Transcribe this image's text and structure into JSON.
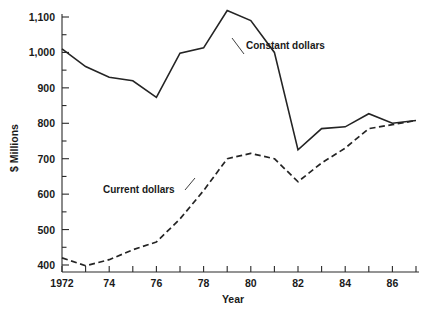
{
  "chart_data": {
    "type": "line",
    "title": "",
    "xlabel": "Year",
    "ylabel": "$ Millions",
    "x": [
      1972,
      1973,
      1974,
      1975,
      1976,
      1977,
      1978,
      1979,
      1980,
      1981,
      1982,
      1983,
      1984,
      1985,
      1986,
      1987
    ],
    "xlim": [
      1972,
      1987
    ],
    "ylim": [
      350,
      1100
    ],
    "grid": false,
    "legend_position": "inline-annotation",
    "x_tick_labels": [
      "1972",
      "",
      "74",
      "",
      "76",
      "",
      "78",
      "",
      "80",
      "",
      "82",
      "",
      "84",
      "",
      "86",
      ""
    ],
    "y_ticks": [
      400,
      450,
      500,
      550,
      600,
      650,
      700,
      750,
      800,
      850,
      900,
      950,
      1000,
      1050,
      1100
    ],
    "y_major_ticks": [
      400,
      500,
      600,
      700,
      800,
      900,
      1000,
      1100
    ],
    "y_tick_labels": [
      "400",
      "500",
      "600",
      "700",
      "800",
      "900",
      "1,000",
      "1,100"
    ],
    "series": [
      {
        "name": "Constant dollars",
        "style": "solid",
        "values": [
          1010,
          960,
          930,
          920,
          873,
          998,
          1013,
          1118,
          1090,
          1000,
          725,
          785,
          790,
          827,
          800,
          808
        ]
      },
      {
        "name": "Current dollars",
        "style": "dashed",
        "values": [
          420,
          398,
          415,
          443,
          465,
          530,
          610,
          700,
          715,
          700,
          635,
          688,
          730,
          785,
          796,
          808
        ]
      }
    ],
    "annotations": [
      {
        "text": "Constant dollars",
        "x": 1978.6,
        "y": 1043
      },
      {
        "text": "Current dollars",
        "x": 1974.3,
        "y": 586
      }
    ]
  },
  "axis": {
    "y_label": "$ Millions",
    "x_label": "Year"
  }
}
